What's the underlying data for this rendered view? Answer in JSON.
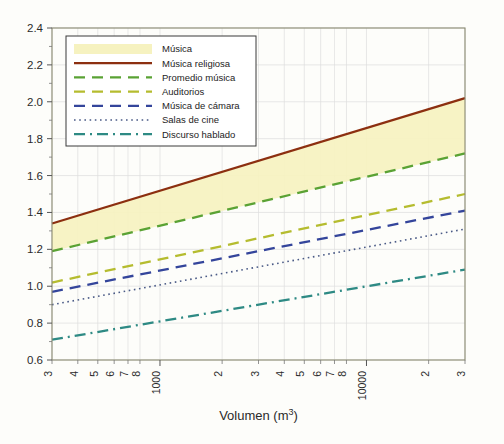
{
  "chart_data": {
    "type": "line",
    "title": "",
    "xlabel": "Volumen (m",
    "xlabel_sup": "3",
    "xlabel_tail": ")",
    "ylabel": "",
    "xscale": "log",
    "xlim": [
      300,
      30000
    ],
    "ylim": [
      0.6,
      2.4
    ],
    "ytick_labels": [
      "2.4",
      "2.2",
      "2.0",
      "1.8",
      "1.6",
      "1.4",
      "1.2",
      "1.0",
      "0.8",
      "0.6"
    ],
    "ytick_values": [
      2.4,
      2.2,
      2.0,
      1.8,
      1.6,
      1.4,
      1.2,
      1.0,
      0.8,
      0.6
    ],
    "yminor_step": 0.1,
    "xtick_labels": [
      "3",
      "4",
      "5",
      "6",
      "7",
      "8",
      "1000",
      "2",
      "3",
      "4",
      "5",
      "6",
      "7",
      "8",
      "10000",
      "2",
      "3"
    ],
    "xtick_values": [
      300,
      400,
      500,
      600,
      700,
      800,
      1000,
      2000,
      3000,
      4000,
      5000,
      6000,
      7000,
      8000,
      10000,
      20000,
      30000
    ],
    "grid": true,
    "legend_position": "upper-left",
    "series": [
      {
        "name": "Música",
        "style": "band",
        "color": "#f6f2c0",
        "x": [
          300,
          30000
        ],
        "y_lower": [
          1.19,
          1.72
        ],
        "y_upper": [
          1.34,
          2.02
        ]
      },
      {
        "name": "Música religiosa",
        "style": "solid",
        "color": "#8c2f10",
        "x": [
          300,
          30000
        ],
        "y": [
          1.34,
          2.02
        ]
      },
      {
        "name": "Promedio música",
        "style": "dashed",
        "color": "#5aa234",
        "x": [
          300,
          30000
        ],
        "y": [
          1.19,
          1.72
        ]
      },
      {
        "name": "Auditorios",
        "style": "dashed",
        "color": "#b5bc2f",
        "x": [
          300,
          30000
        ],
        "y": [
          1.02,
          1.5
        ]
      },
      {
        "name": "Música de cámara",
        "style": "dashed",
        "color": "#34459b",
        "x": [
          300,
          30000
        ],
        "y": [
          0.97,
          1.41
        ]
      },
      {
        "name": "Salas de cine",
        "style": "dotted",
        "color": "#4a5a86",
        "x": [
          300,
          30000
        ],
        "y": [
          0.9,
          1.31
        ]
      },
      {
        "name": "Discurso hablado",
        "style": "dashdot",
        "color": "#2e8a84",
        "x": [
          300,
          30000
        ],
        "y": [
          0.71,
          1.09
        ]
      }
    ]
  }
}
